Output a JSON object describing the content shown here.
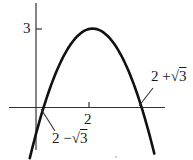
{
  "chart_data": {
    "type": "line",
    "title": "",
    "xlabel": "",
    "ylabel": "",
    "function": "y = 3 - (x - 2)^2",
    "vertex": {
      "x": 2,
      "y": 3
    },
    "roots": [
      0.268,
      3.732
    ],
    "root_labels": [
      "2 −√3",
      "2 +√3"
    ],
    "x_ticks": [
      {
        "value": 2,
        "label": "2"
      }
    ],
    "y_ticks": [
      {
        "value": 3,
        "label": "3"
      }
    ],
    "xlim": [
      -0.95,
      5.3
    ],
    "ylim": [
      -1.45,
      4.0
    ],
    "grid": false,
    "legend": null,
    "colors": {
      "curve": "#111111",
      "axes": "#333333"
    }
  },
  "labels": {
    "y_tick_3": "3",
    "x_tick_2": "2",
    "root_left": "2 −",
    "root_left_radicand": "3",
    "root_right": "2 +",
    "root_right_radicand": "3",
    "sqrt_symbol": "√"
  }
}
